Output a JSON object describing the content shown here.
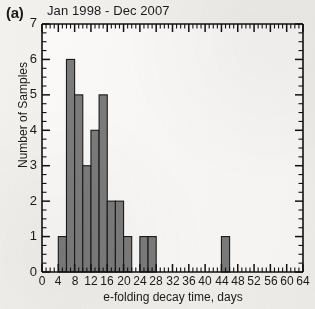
{
  "panel": {
    "label": "(a)"
  },
  "header": {
    "date_range": "Jan 1998 - Dec 2007"
  },
  "annotations": {
    "title": "Early Decay Intervals",
    "l_shell": "L = 3",
    "events": "32  Events"
  },
  "axes": {
    "ylabel": "Number of Samples",
    "xlabel": "e-folding decay time, days",
    "ytick_labels": [
      "0",
      "1",
      "2",
      "3",
      "4",
      "5",
      "6",
      "7"
    ],
    "xtick_labels": [
      "0",
      "4",
      "8",
      "12",
      "16",
      "20",
      "24",
      "28",
      "32",
      "36",
      "40",
      "44",
      "48",
      "52",
      "56",
      "60",
      "64"
    ]
  },
  "style": {
    "bar_fill": "#7c7c7c",
    "bar_stroke": "#1a1a1a",
    "axis_color": "#111111",
    "background": "#f2f1ee",
    "plot_background": "#fbfaf8"
  },
  "chart_data": {
    "type": "bar",
    "title": "Early Decay Intervals",
    "xlabel": "e-folding decay time, days",
    "ylabel": "Number of Samples",
    "xlim": [
      0,
      64
    ],
    "ylim": [
      0,
      7
    ],
    "bin_width": 2,
    "grid": false,
    "legend": null,
    "total_events": 32,
    "categories": [
      "0-2",
      "2-4",
      "4-6",
      "6-8",
      "8-10",
      "10-12",
      "12-14",
      "14-16",
      "16-18",
      "18-20",
      "20-22",
      "22-24",
      "24-26",
      "26-28",
      "28-30",
      "30-32",
      "32-34",
      "34-36",
      "36-38",
      "38-40",
      "40-42",
      "42-44",
      "44-46",
      "46-48",
      "48-50",
      "50-52",
      "52-54",
      "54-56",
      "56-58",
      "58-60",
      "60-62",
      "62-64"
    ],
    "bin_left_edges": [
      0,
      2,
      4,
      6,
      8,
      10,
      12,
      14,
      16,
      18,
      20,
      22,
      24,
      26,
      28,
      30,
      32,
      34,
      36,
      38,
      40,
      42,
      44,
      46,
      48,
      50,
      52,
      54,
      56,
      58,
      60,
      62
    ],
    "values": [
      0,
      0,
      1,
      6,
      5,
      3,
      4,
      5,
      2,
      2,
      1,
      0,
      1,
      1,
      0,
      0,
      0,
      0,
      0,
      0,
      0,
      0,
      1,
      0,
      0,
      0,
      0,
      0,
      0,
      0,
      0,
      0
    ]
  }
}
